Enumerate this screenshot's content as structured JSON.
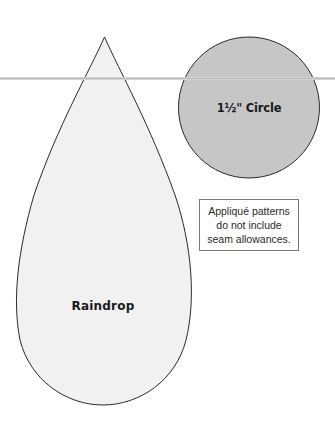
{
  "shapes": {
    "circle": {
      "label": "1½\" Circle",
      "fill": "#c6c6c6",
      "stroke": "#2b2b2b"
    },
    "raindrop": {
      "label": "Raindrop",
      "fill": "#f1f1f1",
      "stroke": "#2b2b2b"
    }
  },
  "note": {
    "lines": [
      "Appliqué patterns",
      "do not include",
      "seam allowances."
    ]
  },
  "fold_line": {
    "color": "#b8b8b8"
  }
}
